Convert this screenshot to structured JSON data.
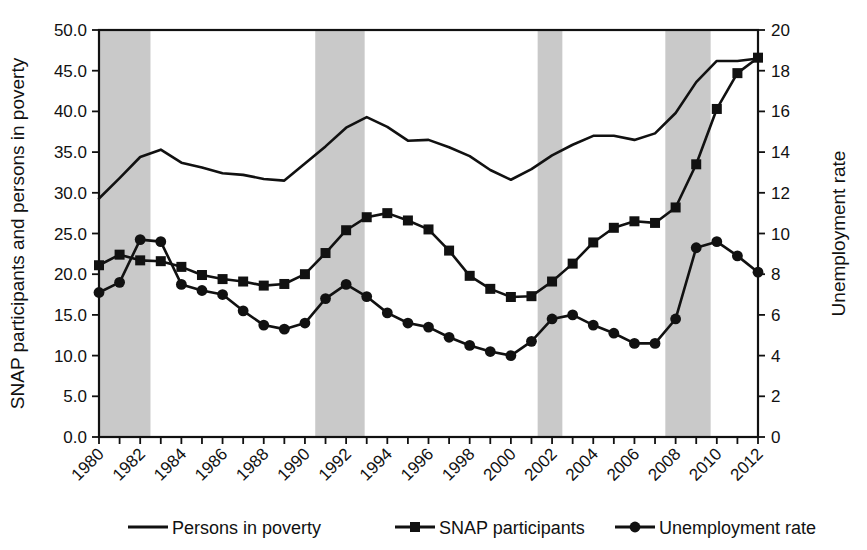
{
  "chart_data": {
    "type": "line",
    "title": "",
    "xlabel": "",
    "ylabel": "SNAP participants and persons in poverty",
    "y2label": "Unemployment rate",
    "ylim": [
      0,
      50
    ],
    "y2lim": [
      0,
      20
    ],
    "ytick_labels": [
      "0.0",
      "5.0",
      "10.0",
      "15.0",
      "20.0",
      "25.0",
      "30.0",
      "35.0",
      "40.0",
      "45.0",
      "50.0"
    ],
    "ytick_values": [
      0,
      5,
      10,
      15,
      20,
      25,
      30,
      35,
      40,
      45,
      50
    ],
    "y2tick_labels": [
      "0",
      "2",
      "4",
      "6",
      "8",
      "10",
      "12",
      "14",
      "16",
      "18",
      "20"
    ],
    "y2tick_values": [
      0,
      2,
      4,
      6,
      8,
      10,
      12,
      14,
      16,
      18,
      20
    ],
    "grid": false,
    "legend_position": "bottom",
    "x": [
      1980,
      1981,
      1982,
      1983,
      1984,
      1985,
      1986,
      1987,
      1988,
      1989,
      1990,
      1991,
      1992,
      1993,
      1994,
      1995,
      1996,
      1997,
      1998,
      1999,
      2000,
      2001,
      2002,
      2003,
      2004,
      2005,
      2006,
      2007,
      2008,
      2009,
      2010,
      2011,
      2012
    ],
    "xtick_labels": [
      "1980",
      "1982",
      "1984",
      "1986",
      "1988",
      "1990",
      "1992",
      "1994",
      "1996",
      "1998",
      "2000",
      "2002",
      "2004",
      "2006",
      "2008",
      "2010",
      "2012"
    ],
    "xlim": [
      1980,
      2012
    ],
    "series": [
      {
        "name": "Persons in poverty",
        "axis": "left",
        "marker": "none",
        "values": [
          29.3,
          31.8,
          34.4,
          35.3,
          33.7,
          33.1,
          32.4,
          32.2,
          31.7,
          31.5,
          33.6,
          35.7,
          38.0,
          39.3,
          38.1,
          36.4,
          36.5,
          35.6,
          34.5,
          32.8,
          31.6,
          32.9,
          34.6,
          35.9,
          37.0,
          37.0,
          36.5,
          37.3,
          39.8,
          43.6,
          46.2,
          46.2,
          46.5
        ]
      },
      {
        "name": "SNAP participants",
        "axis": "left",
        "marker": "square",
        "values": [
          21.1,
          22.4,
          21.7,
          21.6,
          20.9,
          19.9,
          19.4,
          19.1,
          18.6,
          18.8,
          20.0,
          22.6,
          25.4,
          27.0,
          27.5,
          26.6,
          25.5,
          22.9,
          19.8,
          18.2,
          17.2,
          17.3,
          19.1,
          21.3,
          23.9,
          25.7,
          26.5,
          26.3,
          28.2,
          33.5,
          40.3,
          44.7,
          46.6
        ]
      },
      {
        "name": "Unemployment rate",
        "axis": "right",
        "marker": "circle",
        "values": [
          7.1,
          7.6,
          9.7,
          9.6,
          7.5,
          7.2,
          7.0,
          6.2,
          5.5,
          5.3,
          5.6,
          6.8,
          7.5,
          6.9,
          6.1,
          5.6,
          5.4,
          4.9,
          4.5,
          4.2,
          4.0,
          4.7,
          5.8,
          6.0,
          5.5,
          5.1,
          4.6,
          4.6,
          5.8,
          9.3,
          9.6,
          8.9,
          8.1
        ]
      }
    ],
    "recession_bands": [
      {
        "start": 1980.0,
        "end": 1982.5
      },
      {
        "start": 1990.5,
        "end": 1992.9
      },
      {
        "start": 2001.3,
        "end": 2002.5
      },
      {
        "start": 2007.5,
        "end": 2009.7
      }
    ],
    "recession_color": "#c9c9c9"
  },
  "legend": {
    "items": [
      {
        "label": "Persons in poverty",
        "marker": "none"
      },
      {
        "label": "SNAP participants",
        "marker": "square"
      },
      {
        "label": "Unemployment rate",
        "marker": "circle"
      }
    ]
  }
}
